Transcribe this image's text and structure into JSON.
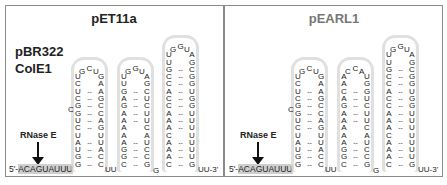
{
  "panels": [
    {
      "title": "pET11a",
      "plasmid_label": [
        "pBR322",
        "ColE1"
      ],
      "enzyme_label": "RNase E",
      "five_prime": {
        "prefix": "5'-",
        "seq": "ACAGUAUUU"
      },
      "three_prime": "UU-3'",
      "linkers": [
        "UU",
        "G"
      ],
      "hairpins": [
        {
          "five_side": "UCUCGGUCUAUGG",
          "loop": "GCU",
          "three_side": "GAAGCCAGUUACC",
          "bulge": "C"
        },
        {
          "five_side": "UUGAGAAAAAGGC",
          "loop": "GGU",
          "three_side": "AGCUCUUCAUCCG"
        },
        {
          "five_side": "UUGCCACCAAACAAAC",
          "loop": "GGU",
          "three_side": "AGCGGUGGUUUUUUUG"
        }
      ]
    },
    {
      "title": "pEARL1",
      "enzyme_label": "RNase E",
      "five_prime": {
        "prefix": "5'-",
        "seq": "ACAGUAUUU"
      },
      "three_prime": "UU-3'",
      "linkers": [
        "UU",
        "G"
      ],
      "hairpins": [
        {
          "five_side": "UCUCGGUCUAUGG",
          "loop": "GCU",
          "three_side": "GAAGCCAGUUACC",
          "bulge": "C"
        },
        {
          "five_side": "AACAGAAAAAGGC",
          "loop": "CCA",
          "three_side": "UGGUCUUCAUCCG"
        },
        {
          "five_side": "UUGCCACCAAACAAAC",
          "loop": "GGU",
          "three_side": "AGCGGUGGUUUUUUUG"
        }
      ]
    }
  ]
}
